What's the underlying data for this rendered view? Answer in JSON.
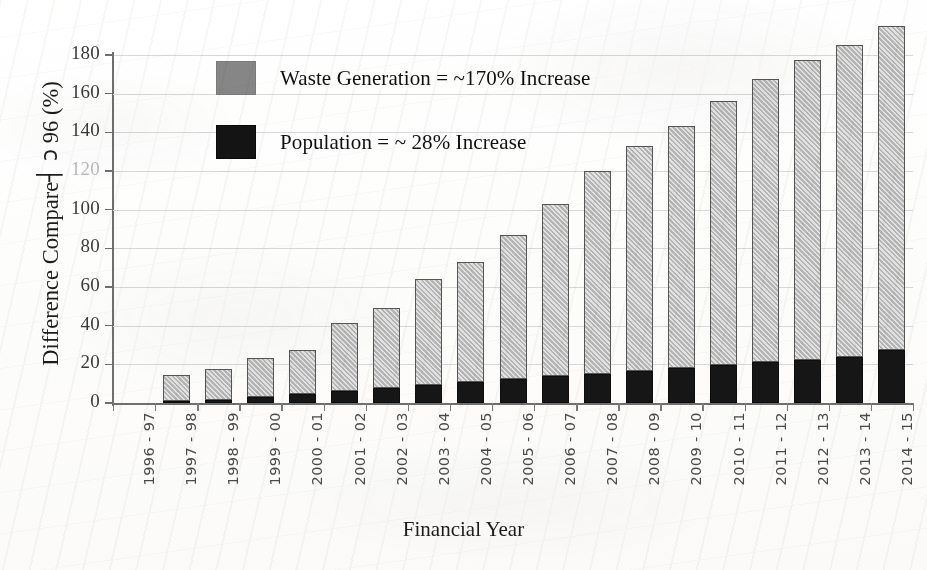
{
  "chart_data": {
    "type": "bar",
    "subtype": "stacked-bar",
    "title": "",
    "xlabel": "Financial Year",
    "ylabel": "Difference Compared to 96 (%)",
    "ylabel_rendered": "Difference Compare┤ ɔ 96 (%)",
    "ylim": [
      0,
      190
    ],
    "yticks": [
      0,
      20,
      40,
      60,
      80,
      100,
      120,
      140,
      160,
      180
    ],
    "ytick_labels": [
      "0",
      "20",
      "40",
      "60",
      "80",
      "100",
      "120",
      "140",
      "160",
      "180"
    ],
    "grid": "horizontal",
    "legend_position": "upper-left-inside",
    "categories": [
      "1996 - 97",
      "1997 - 98",
      "1998 - 99",
      "1999 - 00",
      "2000 - 01",
      "2001 - 02",
      "2002 - 03",
      "2003 - 04",
      "2004 - 05",
      "2005 - 06",
      "2006 - 07",
      "2007 - 08",
      "2008 - 09",
      "2009 - 10",
      "2010 - 11",
      "2011 - 12",
      "2012 - 13",
      "2013 - 14",
      "2014 - 15"
    ],
    "series": [
      {
        "name": "Population",
        "color": "#161616",
        "legend_text": "Population = ~ 28% Increase",
        "values": [
          0,
          0.8,
          1.8,
          3.0,
          4.6,
          6.2,
          7.8,
          9.2,
          10.7,
          12.4,
          14.0,
          15.2,
          16.6,
          18.2,
          19.8,
          21.0,
          22.2,
          23.8,
          27.5
        ]
      },
      {
        "name": "Waste Generation",
        "color": "#b4b4b4",
        "legend_text": "Waste Generation = ~170% Increase",
        "values": [
          0,
          13.7,
          15.7,
          20.5,
          22.6,
          35.2,
          41.2,
          54.8,
          62.3,
          74.6,
          89.0,
          105.0,
          116.4,
          125.0,
          136.2,
          146.8,
          155.0,
          161.4,
          167.5
        ]
      }
    ],
    "totals": [
      0,
      14.5,
      17.5,
      23.5,
      27.2,
      41.4,
      49.0,
      64.0,
      73.0,
      87.0,
      103.0,
      120.2,
      133.0,
      143.2,
      156.0,
      167.8,
      177.2,
      185.2,
      195.0
    ]
  },
  "legend": {
    "items": [
      {
        "swatch": "waste",
        "label": "Waste Generation = ~170% Increase"
      },
      {
        "swatch": "pop",
        "label": "Population = ~ 28% Increase"
      }
    ]
  },
  "axis_titles": {
    "y_prefix": "Difference Compare",
    "y_artifact": "┤  ɔ",
    "y_suffix": "96 (%)",
    "x": "Financial Year"
  }
}
